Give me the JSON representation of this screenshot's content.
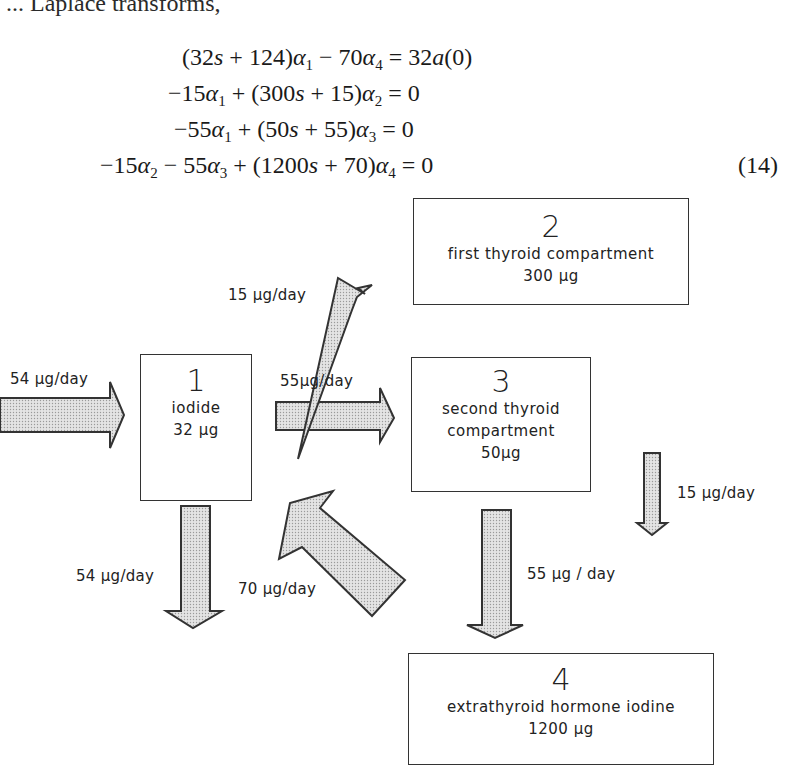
{
  "intro_text": "... Laplace transforms,",
  "equations": [
    "(32s + 124)α1 − 70α4 = 32a(0)",
    "−15α1 + (300s + 15)α2 = 0",
    "−55α1 + (50s + 55)α3 = 0",
    "−15α2 − 55α3 + (1200s + 70)α4 = 0"
  ],
  "equation_number": "(14)",
  "compartments": [
    {
      "id": "1",
      "name": "iodide",
      "name_line2": "",
      "amount": "32 µg"
    },
    {
      "id": "2",
      "name": "first thyroid compartment",
      "name_line2": "",
      "amount": "300 µg"
    },
    {
      "id": "3",
      "name": "second thyroid",
      "name_line2": "compartment",
      "amount": "50µg"
    },
    {
      "id": "4",
      "name": "extrathyroid hormone iodine",
      "name_line2": "",
      "amount": "1200 µg"
    }
  ],
  "flows": [
    {
      "label": "54 µg/day",
      "from": "outside",
      "to": "1"
    },
    {
      "label": "55µg/day",
      "from": "1",
      "to": "3"
    },
    {
      "label": "15 µg/day",
      "from": "1",
      "to": "2"
    },
    {
      "label": "15 µg/day",
      "from": "2",
      "to": "4"
    },
    {
      "label": "54 µg/day",
      "from": "1",
      "to": "outside"
    },
    {
      "label": "70 µg/day",
      "from": "4",
      "to": "1"
    },
    {
      "label": "55 µg / day",
      "from": "3",
      "to": "4"
    }
  ],
  "colors": {
    "arrow_fill": "#d9d9d9",
    "stroke": "#333333"
  }
}
